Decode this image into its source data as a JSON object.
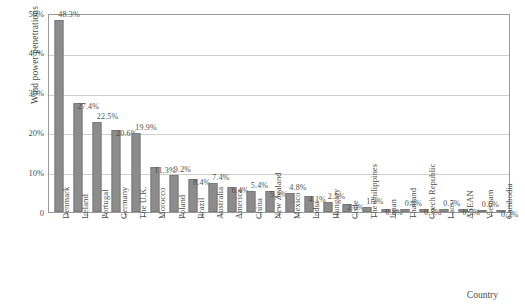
{
  "chart_data": {
    "type": "bar",
    "title": "",
    "subtitle": "",
    "xlabel": "Country",
    "ylabel": "Wind power penetrations",
    "ylim": [
      0,
      50
    ],
    "ytick_labels": [
      "0",
      "10%",
      "20%",
      "30%",
      "40%",
      "50%"
    ],
    "ytick_values": [
      0,
      10,
      20,
      30,
      40,
      50
    ],
    "grid": "horizontal",
    "legend": "none",
    "bar_color": "#8c8c8c",
    "categories": [
      "Denmark",
      "Ireland",
      "Portugal",
      "Germany",
      "The U.K.",
      "Morocco",
      "Poland",
      "Brazil",
      "Australia",
      "America",
      "China",
      "New Zealand",
      "Mexico",
      "India",
      "Hungary",
      "Chile",
      "The Philippines",
      "Japan",
      "Thailand",
      "Czech Republic",
      "Laos",
      "ASEAN",
      "Vietnam",
      "Cambodia"
    ],
    "values": [
      48.3,
      27.4,
      22.5,
      20.6,
      19.9,
      11.3,
      9.2,
      8.4,
      7.4,
      6.4,
      5.4,
      5.2,
      4.8,
      4.1,
      2.5,
      2.0,
      1.2,
      0.8,
      0.8,
      0.7,
      0.7,
      0.7,
      0.6,
      0.2
    ],
    "data_labels": [
      "48.3%",
      "27.4%",
      "22.5%",
      "20.6%",
      "19.9%",
      "11.3%",
      "9.2%",
      "8.4%",
      "7.4%",
      "6.4%",
      "5.4%",
      "5.2%",
      "4.8%",
      "4.1%",
      "2.5%",
      "2.0%",
      "1.2%",
      "0.8%",
      "0.8%",
      "0.7%",
      "0.7%",
      "0.7%",
      "0.6%",
      "0.2%"
    ],
    "label_offsets_alternate": true
  }
}
